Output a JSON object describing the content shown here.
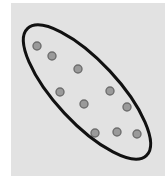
{
  "diagram": {
    "type": "cluster-ellipse",
    "canvas": {
      "width": 168,
      "height": 185,
      "background": "#ffffff"
    },
    "panel": {
      "x": 11,
      "y": 3,
      "width": 154,
      "height": 173,
      "fill": "#e2e2e2"
    },
    "ellipse": {
      "cx": 87,
      "cy": 92,
      "rx": 87,
      "ry": 31,
      "rotation_deg": 47,
      "stroke": "#111111",
      "stroke_width": 3
    },
    "dot_style": {
      "r": 4,
      "fill": "#9a9a9a",
      "stroke": "#6e6e6e",
      "stroke_width": 1.4
    },
    "points": [
      {
        "x": 37,
        "y": 46
      },
      {
        "x": 52,
        "y": 56
      },
      {
        "x": 78,
        "y": 69
      },
      {
        "x": 60,
        "y": 92
      },
      {
        "x": 110,
        "y": 91
      },
      {
        "x": 84,
        "y": 104
      },
      {
        "x": 127,
        "y": 107
      },
      {
        "x": 95,
        "y": 133
      },
      {
        "x": 117,
        "y": 132
      },
      {
        "x": 137,
        "y": 134
      }
    ]
  }
}
